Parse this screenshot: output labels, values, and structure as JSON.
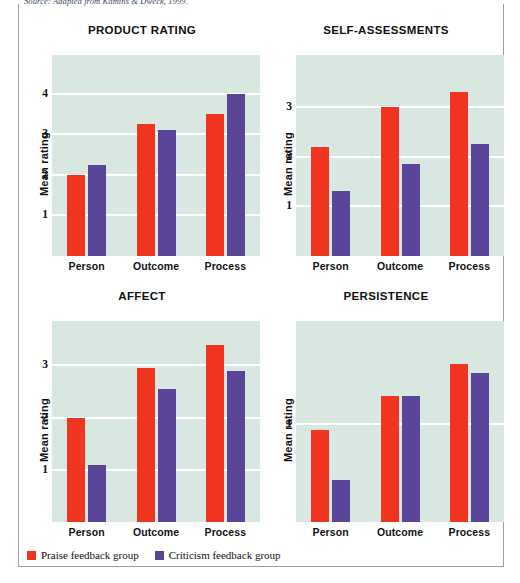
{
  "source_note": "Source: Adapted from Kamins & Dweck, 1999.",
  "legend": {
    "items": [
      {
        "label": "Praise feedback group",
        "color": "#f0341f",
        "swatch_name": "praise-swatch"
      },
      {
        "label": "Criticism feedback group",
        "color": "#5b4599",
        "swatch_name": "criticism-swatch"
      }
    ]
  },
  "colors": {
    "praise": "#f0341f",
    "criticism": "#5b4599",
    "plot_background": "#d9e7e1",
    "gridline": "#ffffff",
    "text": "#111111"
  },
  "chart_data": [
    {
      "type": "bar",
      "title": "PRODUCT RATING",
      "xlabel": "",
      "ylabel": "Mean rating",
      "categories": [
        "Person",
        "Outcome",
        "Process"
      ],
      "yticks": [
        1,
        2,
        3,
        4
      ],
      "ylim": [
        0.0,
        4.95
      ],
      "grid": true,
      "legend_position": "bottom",
      "series": [
        {
          "name": "Praise feedback group",
          "color": "#f0341f",
          "values": [
            2.0,
            3.25,
            3.5
          ]
        },
        {
          "name": "Criticism feedback group",
          "color": "#5b4599",
          "values": [
            2.25,
            3.1,
            4.0
          ]
        }
      ]
    },
    {
      "type": "bar",
      "title": "SELF-ASSESSMENTS",
      "xlabel": "",
      "ylabel": "Mean rating",
      "categories": [
        "Person",
        "Outcome",
        "Process"
      ],
      "yticks": [
        1,
        2,
        3
      ],
      "ylim": [
        0.0,
        4.05
      ],
      "grid": true,
      "legend_position": "bottom",
      "series": [
        {
          "name": "Praise feedback group",
          "color": "#f0341f",
          "values": [
            2.2,
            3.0,
            3.3
          ]
        },
        {
          "name": "Criticism feedback group",
          "color": "#5b4599",
          "values": [
            1.3,
            1.85,
            2.25
          ]
        }
      ]
    },
    {
      "type": "bar",
      "title": "AFFECT",
      "xlabel": "",
      "ylabel": "Mean rating",
      "categories": [
        "Person",
        "Outcome",
        "Process"
      ],
      "yticks": [
        1,
        2,
        3
      ],
      "ylim": [
        0.0,
        3.85
      ],
      "grid": true,
      "legend_position": "bottom",
      "series": [
        {
          "name": "Praise feedback group",
          "color": "#f0341f",
          "values": [
            2.0,
            2.95,
            3.4
          ]
        },
        {
          "name": "Criticism feedback group",
          "color": "#5b4599",
          "values": [
            1.1,
            2.55,
            2.9
          ]
        }
      ]
    },
    {
      "type": "bar",
      "title": "PERSISTENCE",
      "xlabel": "",
      "ylabel": "Mean rating",
      "categories": [
        "Person",
        "Outcome",
        "Process"
      ],
      "yticks": [
        1
      ],
      "ylim": [
        0.0,
        2.05
      ],
      "grid": true,
      "legend_position": "bottom",
      "series": [
        {
          "name": "Praise feedback group",
          "color": "#f0341f",
          "values": [
            0.94,
            1.29,
            1.61
          ]
        },
        {
          "name": "Criticism feedback group",
          "color": "#5b4599",
          "values": [
            0.43,
            1.29,
            1.52
          ]
        }
      ]
    }
  ]
}
